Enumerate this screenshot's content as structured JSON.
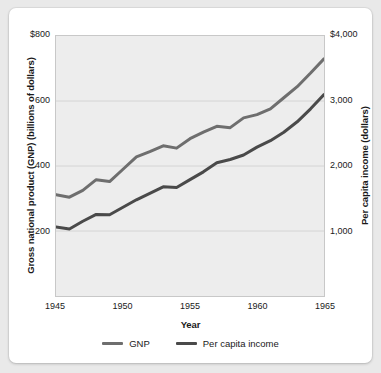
{
  "chart_data": {
    "type": "line",
    "title": "",
    "xlabel": "Year",
    "ylabel": "Gross national product (GNP) (billions of dollars)",
    "ylabel_right": "Per capita income (dollars)",
    "x": [
      1945,
      1946,
      1947,
      1948,
      1949,
      1950,
      1951,
      1952,
      1953,
      1954,
      1955,
      1956,
      1957,
      1958,
      1959,
      1960,
      1961,
      1962,
      1963,
      1964,
      1965
    ],
    "xlim": [
      1945,
      1965
    ],
    "xticks": [
      1945,
      1950,
      1955,
      1960,
      1965
    ],
    "xticklabels": [
      "1945",
      "1950",
      "1955",
      "1960",
      "1965"
    ],
    "ylim": [
      0,
      800
    ],
    "yticks": [
      200,
      400,
      600,
      800
    ],
    "yticklabels": [
      "200",
      "400",
      "600",
      "$800"
    ],
    "ylim_right": [
      0,
      4000
    ],
    "yticks_right": [
      1000,
      2000,
      3000,
      4000
    ],
    "yticklabels_right": [
      "1,000",
      "2,000",
      "3,000",
      "$4,000"
    ],
    "grid": true,
    "legend_position": "bottom",
    "series": [
      {
        "name": "GNP",
        "axis": "left",
        "color": "#6e6e6e",
        "values": [
          312,
          304,
          325,
          358,
          352,
          390,
          428,
          444,
          462,
          455,
          484,
          504,
          522,
          518,
          548,
          558,
          576,
          610,
          644,
          686,
          730
        ]
      },
      {
        "name": "Per capita income",
        "axis": "right",
        "color": "#4a4a4a",
        "values": [
          1060,
          1030,
          1150,
          1255,
          1250,
          1365,
          1480,
          1580,
          1680,
          1670,
          1790,
          1910,
          2050,
          2100,
          2170,
          2290,
          2390,
          2520,
          2680,
          2880,
          3100
        ]
      }
    ]
  },
  "axes": {
    "left_title": "Gross national product (GNP) (billions of dollars)",
    "right_title": "Per capita income (dollars)",
    "x_title": "Year"
  },
  "legend": {
    "items": [
      {
        "label": "GNP",
        "color": "#6e6e6e"
      },
      {
        "label": "Per capita income",
        "color": "#4a4a4a"
      }
    ]
  },
  "style": {
    "plot_background": "#ededed",
    "card_background": "#ffffff",
    "page_background": "#e9e9e9",
    "grid_color": "#d4d4d4",
    "border_color": "#c8c8c8"
  }
}
